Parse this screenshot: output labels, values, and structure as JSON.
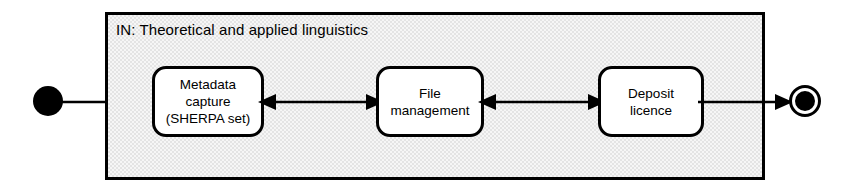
{
  "diagram": {
    "type": "uml-state-diagram",
    "canvas": {
      "width": 852,
      "height": 195,
      "background": "#ffffff"
    },
    "container": {
      "title": "IN: Theoretical and applied linguistics",
      "border_color": "#000000",
      "fill_color": "#e4e4e4",
      "fill_pattern": "halftone-dither"
    },
    "states": [
      {
        "id": "metadata-capture",
        "lines": [
          "Metadata",
          "capture",
          "(SHERPA set)"
        ]
      },
      {
        "id": "file-management",
        "lines": [
          "File",
          "management"
        ]
      },
      {
        "id": "deposit-licence",
        "lines": [
          "Deposit",
          "licence"
        ]
      }
    ],
    "pseudo_states": {
      "initial": {
        "name": "initial-node",
        "shape": "filled-circle",
        "color": "#000000"
      },
      "final": {
        "name": "final-node",
        "shape": "bullseye-circle",
        "color": "#000000"
      }
    },
    "transitions": [
      {
        "id": "start-to-metadata",
        "from": "initial",
        "to": "metadata-capture",
        "direction": "forward"
      },
      {
        "id": "metadata-to-file",
        "from": "metadata-capture",
        "to": "file-management",
        "direction": "bidirectional"
      },
      {
        "id": "file-to-deposit",
        "from": "file-management",
        "to": "deposit-licence",
        "direction": "bidirectional"
      },
      {
        "id": "deposit-to-end",
        "from": "deposit-licence",
        "to": "final",
        "direction": "forward"
      }
    ]
  }
}
